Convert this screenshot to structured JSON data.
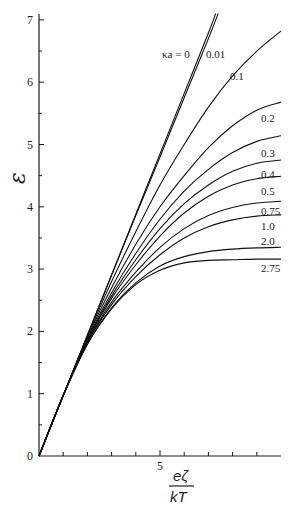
{
  "chart_data": {
    "type": "line",
    "title": "",
    "xlabel": "eζ/kT",
    "xlabel_num": "eζ",
    "xlabel_den": "kT",
    "ylabel": "ε",
    "xlim": [
      0,
      10
    ],
    "ylim": [
      0,
      7
    ],
    "xticks": [
      1,
      2,
      3,
      4,
      5,
      6,
      7,
      8,
      9
    ],
    "xtick_labels": [
      {
        "x": 5,
        "label": "5"
      }
    ],
    "yticks": [
      0,
      0.5,
      1,
      1.5,
      2,
      2.5,
      3,
      3.5,
      4,
      4.5,
      5,
      5.5,
      6,
      6.5,
      7
    ],
    "ytick_labels": [
      {
        "y": 0,
        "label": "0"
      },
      {
        "y": 1,
        "label": "1"
      },
      {
        "y": 2,
        "label": "2"
      },
      {
        "y": 3,
        "label": "3"
      },
      {
        "y": 4,
        "label": "4"
      },
      {
        "y": 5,
        "label": "5"
      },
      {
        "y": 6,
        "label": "6"
      },
      {
        "y": 7,
        "label": "7"
      }
    ],
    "grid": false,
    "legend_position": "inline labels at curve ends",
    "series": [
      {
        "name": "κa = 0",
        "label": "κa = 0",
        "x": [
          0,
          1,
          2,
          3,
          4,
          5,
          6,
          7,
          7.3
        ],
        "y": [
          0,
          0.97,
          1.94,
          2.91,
          3.88,
          4.85,
          5.82,
          6.79,
          7.1
        ]
      },
      {
        "name": "0.01",
        "label": "0.01",
        "x": [
          0,
          1,
          2,
          3,
          4,
          5,
          6,
          7,
          7.4
        ],
        "y": [
          0,
          0.97,
          1.94,
          2.9,
          3.86,
          4.8,
          5.75,
          6.7,
          7.1
        ]
      },
      {
        "name": "0.1",
        "label": "0.1",
        "x": [
          0,
          1,
          2,
          3,
          4,
          5,
          6,
          7,
          8,
          9,
          10
        ],
        "y": [
          0,
          0.97,
          1.92,
          2.8,
          3.6,
          4.35,
          5.0,
          5.6,
          6.1,
          6.5,
          6.82
        ]
      },
      {
        "name": "0.2",
        "label": "0.2",
        "x": [
          0,
          1,
          2,
          3,
          4,
          5,
          6,
          7,
          8,
          9,
          10
        ],
        "y": [
          0,
          0.97,
          1.9,
          2.7,
          3.4,
          4.0,
          4.5,
          4.95,
          5.3,
          5.55,
          5.68
        ]
      },
      {
        "name": "0.3",
        "label": "0.3",
        "x": [
          0,
          1,
          2,
          3,
          4,
          5,
          6,
          7,
          8,
          9,
          10
        ],
        "y": [
          0,
          0.97,
          1.88,
          2.62,
          3.25,
          3.8,
          4.25,
          4.6,
          4.87,
          5.05,
          5.14
        ]
      },
      {
        "name": "0.4",
        "label": "0.4",
        "x": [
          0,
          1,
          2,
          3,
          4,
          5,
          6,
          7,
          8,
          9,
          10
        ],
        "y": [
          0,
          0.97,
          1.86,
          2.57,
          3.15,
          3.65,
          4.05,
          4.35,
          4.57,
          4.7,
          4.75
        ]
      },
      {
        "name": "0.5",
        "label": "0.5",
        "x": [
          0,
          1,
          2,
          3,
          4,
          5,
          6,
          7,
          8,
          9,
          10
        ],
        "y": [
          0,
          0.97,
          1.85,
          2.53,
          3.07,
          3.53,
          3.9,
          4.17,
          4.35,
          4.45,
          4.49
        ]
      },
      {
        "name": "0.75",
        "label": "0.75",
        "x": [
          0,
          1,
          2,
          3,
          4,
          5,
          6,
          7,
          8,
          9,
          10
        ],
        "y": [
          0,
          0.97,
          1.83,
          2.47,
          2.95,
          3.35,
          3.65,
          3.86,
          3.99,
          4.06,
          4.09
        ]
      },
      {
        "name": "1.0",
        "label": "1.0",
        "x": [
          0,
          1,
          2,
          3,
          4,
          5,
          6,
          7,
          8,
          9,
          10
        ],
        "y": [
          0,
          0.97,
          1.82,
          2.43,
          2.88,
          3.23,
          3.5,
          3.68,
          3.79,
          3.85,
          3.87
        ]
      },
      {
        "name": "2.0",
        "label": "2.0",
        "x": [
          0,
          1,
          2,
          3,
          4,
          5,
          6,
          7,
          8,
          9,
          10
        ],
        "y": [
          0,
          0.97,
          1.8,
          2.38,
          2.78,
          3.05,
          3.2,
          3.28,
          3.32,
          3.34,
          3.35
        ]
      },
      {
        "name": "2.75",
        "label": "2.75",
        "x": [
          0,
          1,
          2,
          3,
          4,
          5,
          6,
          7,
          8,
          9,
          10
        ],
        "y": [
          0,
          0.97,
          1.79,
          2.36,
          2.75,
          2.98,
          3.1,
          3.14,
          3.15,
          3.16,
          3.16
        ]
      }
    ]
  },
  "labels": {
    "ka0": "κa = 0",
    "s001": "0.01",
    "s01": "0.1",
    "s02": "0.2",
    "s03": "0.3",
    "s04": "0.4",
    "s05": "0.5",
    "s075": "0.75",
    "s10": "1.0",
    "s20": "2.0",
    "s275": "2.75"
  }
}
